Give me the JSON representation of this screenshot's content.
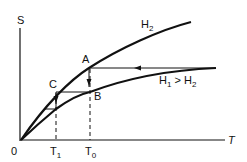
{
  "diagram": {
    "axes": {
      "y_label": "S",
      "x_label": "T",
      "origin_label": "0"
    },
    "curves": [
      {
        "name": "H2",
        "label": "H",
        "subscript": "2"
      },
      {
        "name": "H1",
        "label_main": "H",
        "label_sub1": "1",
        "label_op": " > H",
        "label_sub2": "2"
      }
    ],
    "points": {
      "A": "A",
      "B": "B",
      "C": "C"
    },
    "ticks": {
      "T1_main": "T",
      "T1_sub": "1",
      "T0_main": "T",
      "T0_sub": "0"
    },
    "colors": {
      "line": "#111111",
      "background": "#ffffff"
    }
  }
}
